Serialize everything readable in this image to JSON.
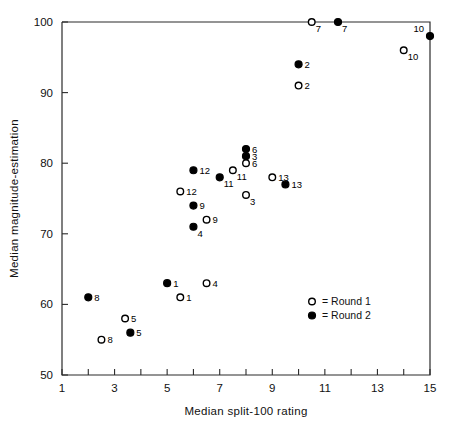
{
  "chart_data": {
    "type": "scatter",
    "title": "",
    "xlabel": "Median split-100 rating",
    "ylabel": "Median magnitude-estimation",
    "xlim": [
      1,
      15
    ],
    "ylim": [
      50,
      100
    ],
    "xticks": [
      1,
      2,
      3,
      4,
      5,
      6,
      7,
      8,
      9,
      10,
      11,
      12,
      13,
      14,
      15
    ],
    "xtick_labels": [
      "1",
      "",
      "3",
      "",
      "5",
      "",
      "7",
      "",
      "9",
      "",
      "11",
      "",
      "13",
      "",
      "15"
    ],
    "yticks": [
      50,
      60,
      70,
      80,
      90,
      100
    ],
    "ytick_labels": [
      "50",
      "60",
      "70",
      "80",
      "90",
      "100"
    ],
    "grid": false,
    "legend_position": "inside-lower-right",
    "legend": [
      {
        "marker": "open-circle",
        "text": "= Round 1"
      },
      {
        "marker": "filled-circle",
        "text": "= Round 2"
      }
    ],
    "series": [
      {
        "name": "Round 1",
        "marker": "open-circle",
        "points": [
          {
            "label": "7",
            "x": 10.5,
            "y": 100.0,
            "label_pos": "below-right"
          },
          {
            "label": "10",
            "x": 14.0,
            "y": 96.0,
            "label_pos": "below-right"
          },
          {
            "label": "2",
            "x": 10.0,
            "y": 91.0,
            "label_pos": "right"
          },
          {
            "label": "6",
            "x": 8.0,
            "y": 80.0,
            "label_pos": "right"
          },
          {
            "label": "11",
            "x": 7.5,
            "y": 79.0,
            "label_pos": "below-right"
          },
          {
            "label": "13",
            "x": 9.0,
            "y": 78.0,
            "label_pos": "right"
          },
          {
            "label": "12",
            "x": 5.5,
            "y": 76.0,
            "label_pos": "right"
          },
          {
            "label": "3",
            "x": 8.0,
            "y": 75.5,
            "label_pos": "below-right"
          },
          {
            "label": "9",
            "x": 6.5,
            "y": 72.0,
            "label_pos": "right"
          },
          {
            "label": "4",
            "x": 6.5,
            "y": 63.0,
            "label_pos": "right"
          },
          {
            "label": "1",
            "x": 5.5,
            "y": 61.0,
            "label_pos": "right"
          },
          {
            "label": "5",
            "x": 3.4,
            "y": 58.0,
            "label_pos": "right"
          },
          {
            "label": "8",
            "x": 2.5,
            "y": 55.0,
            "label_pos": "right"
          }
        ]
      },
      {
        "name": "Round 2",
        "marker": "filled-circle",
        "points": [
          {
            "label": "7",
            "x": 11.5,
            "y": 100.0,
            "label_pos": "below-right"
          },
          {
            "label": "10",
            "x": 15.0,
            "y": 98.0,
            "label_pos": "above-left"
          },
          {
            "label": "2",
            "x": 10.0,
            "y": 94.0,
            "label_pos": "right"
          },
          {
            "label": "6",
            "x": 8.0,
            "y": 82.0,
            "label_pos": "right"
          },
          {
            "label": "3",
            "x": 8.0,
            "y": 81.0,
            "label_pos": "right"
          },
          {
            "label": "12",
            "x": 6.0,
            "y": 79.0,
            "label_pos": "right"
          },
          {
            "label": "11",
            "x": 7.0,
            "y": 78.0,
            "label_pos": "below-right"
          },
          {
            "label": "13",
            "x": 9.5,
            "y": 77.0,
            "label_pos": "right"
          },
          {
            "label": "9",
            "x": 6.0,
            "y": 74.0,
            "label_pos": "right"
          },
          {
            "label": "4",
            "x": 6.0,
            "y": 71.0,
            "label_pos": "below-right"
          },
          {
            "label": "1",
            "x": 5.0,
            "y": 63.0,
            "label_pos": "right"
          },
          {
            "label": "8",
            "x": 2.0,
            "y": 61.0,
            "label_pos": "right"
          },
          {
            "label": "5",
            "x": 3.6,
            "y": 56.0,
            "label_pos": "right"
          }
        ]
      }
    ]
  },
  "colors": {
    "axis": "#2b2b2b",
    "marker": "#000000",
    "background": "#ffffff"
  }
}
